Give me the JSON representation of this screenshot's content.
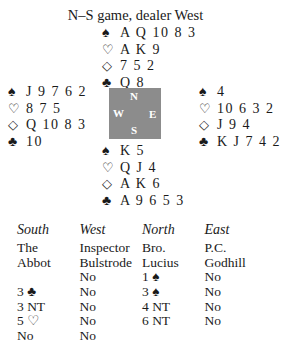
{
  "title": "N–S game, dealer West",
  "hands": {
    "north": {
      "spades": "A Q 10 8 3",
      "hearts": "A K 9",
      "diamonds": "7 5 2",
      "clubs": "Q 8"
    },
    "west": {
      "spades": "J 9 7 6 2",
      "hearts": "8 7 5",
      "diamonds": "Q 10 8 3",
      "clubs": "10"
    },
    "east": {
      "spades": "4",
      "hearts": "10 6 3 2",
      "diamonds": "J 9 4",
      "clubs": "K J 7 4 2"
    },
    "south": {
      "spades": "K 5",
      "hearts": "Q J 4",
      "diamonds": "A K 6",
      "clubs": "A 9 6 5 3"
    }
  },
  "suits": {
    "spades": "♠",
    "hearts": "♡",
    "diamonds": "◇",
    "clubs": "♣"
  },
  "compass": {
    "n": "N",
    "s": "S",
    "w": "W",
    "e": "E"
  },
  "auction": {
    "headers": [
      "South",
      "West",
      "North",
      "East"
    ],
    "players": [
      [
        "The",
        "Inspector",
        "Bro.",
        "P.C."
      ],
      [
        "Abbot",
        "Bulstrode",
        "Lucius",
        "Godhill"
      ]
    ],
    "rows": [
      [
        "",
        "No",
        "1 ♠",
        "No"
      ],
      [
        "3 ♣",
        "No",
        "3 ♠",
        "No"
      ],
      [
        "3 NT",
        "No",
        "4 NT",
        "No"
      ],
      [
        "5 ♡",
        "No",
        "6 NT",
        "No"
      ],
      [
        "No",
        "No",
        "",
        ""
      ]
    ]
  },
  "colors": {
    "compass_bg": "#8c8c8c",
    "text": "#1a1a1a"
  }
}
